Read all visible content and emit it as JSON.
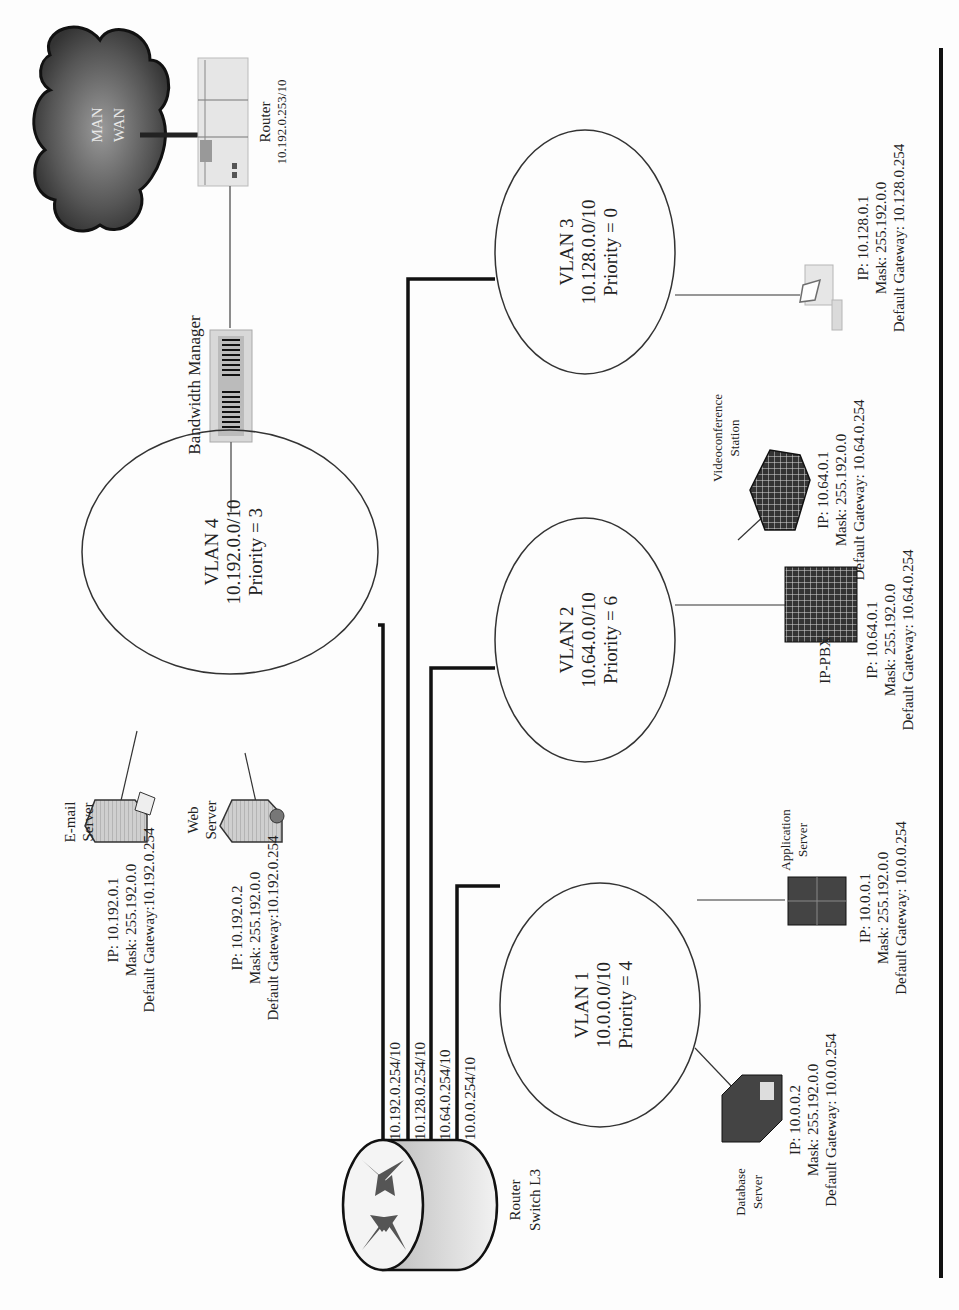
{
  "diagram": {
    "orientation": "rotated-90-ccw",
    "wan_cloud": {
      "line1": "MAN",
      "line2": "WAN"
    },
    "router": {
      "label": "Router",
      "ip": "10.192.0.253/10"
    },
    "bandwidth_manager": {
      "label": "Bandwidth Manager"
    },
    "l3_switch": {
      "line1": "Router",
      "line2": "Switch L3"
    },
    "trunk_ports": [
      "10.192.0.254/10",
      "10.128.0.254/10",
      "10.64.0.254/10",
      "10.0.0.254/10"
    ],
    "vlans": [
      {
        "name": "VLAN 4",
        "subnet": "10.192.0.0/10",
        "priority": "Priority = 3"
      },
      {
        "name": "VLAN 3",
        "subnet": "10.128.0.0/10",
        "priority": "Priority = 0"
      },
      {
        "name": "VLAN 2",
        "subnet": "10.64.0.0/10",
        "priority": "Priority = 6"
      },
      {
        "name": "VLAN 1",
        "subnet": "10.0.0.0/10",
        "priority": "Priority = 4"
      }
    ],
    "hosts": {
      "email_server": {
        "line1": "E-mail",
        "line2": "Server",
        "ip": "IP: 10.192.0.1",
        "mask": "Mask: 255.192.0.0",
        "gw": "Default Gateway:10.192.0.254"
      },
      "web_server": {
        "line1": "Web",
        "line2": "Server",
        "ip": "IP: 10.192.0.2",
        "mask": "Mask: 255.192.0.0",
        "gw": "Default Gateway:10.192.0.254"
      },
      "workstation": {
        "ip": "IP: 10.128.0.1",
        "mask": "Mask: 255.192.0.0",
        "gw": "Default Gateway: 10.128.0.254"
      },
      "videoconference": {
        "line1": "Videoconference",
        "line2": "Station",
        "ip": "IP: 10.64.0.1",
        "mask": "Mask: 255.192.0.0",
        "gw": "Default Gateway: 10.64.0.254"
      },
      "ip_pbx": {
        "line1": "IP-PBX",
        "ip": "IP: 10.64.0.1",
        "mask": "Mask: 255.192.0.0",
        "gw": "Default Gateway: 10.64.0.254"
      },
      "application_server": {
        "line1": "Application",
        "line2": "Server",
        "ip": "IP: 10.0.0.1",
        "mask": "Mask: 255.192.0.0",
        "gw": "Default Gateway: 10.0.0.254"
      },
      "database_server": {
        "line1": "Database",
        "line2": "Server",
        "ip": "IP: 10.0.0.2",
        "mask": "Mask: 255.192.0.0",
        "gw": "Default Gateway: 10.0.0.254"
      }
    }
  }
}
